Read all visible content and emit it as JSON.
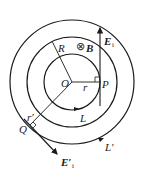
{
  "diagram": {
    "type": "physics-induced-electric-field",
    "labels": {
      "center": "O",
      "field_region_radius": "R",
      "magnetic_field": "B",
      "magnetic_field_symbol": "⊗",
      "point_inside": "P",
      "radius_inside": "r",
      "field_inside": "E",
      "field_inside_sub": "i",
      "loop_inside": "L",
      "point_outside": "Q",
      "radius_outside": "r′",
      "field_outside": "E′",
      "field_outside_sub": "i",
      "loop_outside": "L′"
    },
    "colors": {
      "stroke": "#1a1a1a",
      "background": "#ffffff"
    }
  }
}
